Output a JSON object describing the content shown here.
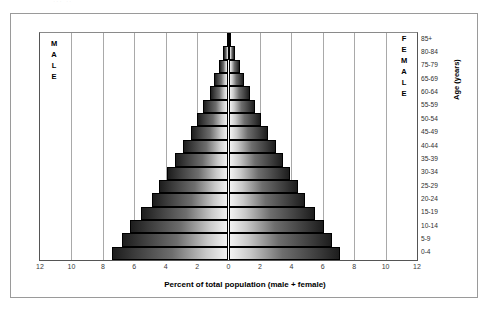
{
  "top_fragment": "... ..",
  "labels": {
    "male": "MALE",
    "female": "FEMALE",
    "age_axis_title": "Age (years)",
    "x_axis_title": "Percent of total population (male + female)"
  },
  "chart_data": {
    "type": "bar",
    "subtype": "population-pyramid",
    "title": "",
    "xlabel": "Percent of total population (male + female)",
    "ylabel": "Age (years)",
    "xlim": [
      -12,
      12
    ],
    "xticks": [
      "12",
      "10",
      "8",
      "6",
      "4",
      "2",
      "0",
      "2",
      "4",
      "6",
      "8",
      "10",
      "12"
    ],
    "xtick_values": [
      -12,
      -10,
      -8,
      -6,
      -4,
      -2,
      0,
      2,
      4,
      6,
      8,
      10,
      12
    ],
    "grid": true,
    "legend_position": "inside-top-left-and-top-right",
    "categories": [
      "0-4",
      "5-9",
      "10-14",
      "15-19",
      "20-24",
      "25-29",
      "30-34",
      "35-39",
      "40-44",
      "45-49",
      "50-54",
      "55-59",
      "60-64",
      "65-69",
      "75-79",
      "80-84",
      "85+"
    ],
    "series": [
      {
        "name": "MALE",
        "side": "left",
        "values": [
          7.4,
          6.8,
          6.3,
          5.6,
          4.9,
          4.4,
          3.9,
          3.4,
          2.9,
          2.4,
          2.0,
          1.6,
          1.2,
          0.9,
          0.6,
          0.35,
          0.12
        ]
      },
      {
        "name": "FEMALE",
        "side": "right",
        "values": [
          7.1,
          6.6,
          6.1,
          5.5,
          4.9,
          4.4,
          3.9,
          3.5,
          3.0,
          2.5,
          2.1,
          1.7,
          1.35,
          1.0,
          0.7,
          0.42,
          0.14
        ]
      }
    ]
  }
}
